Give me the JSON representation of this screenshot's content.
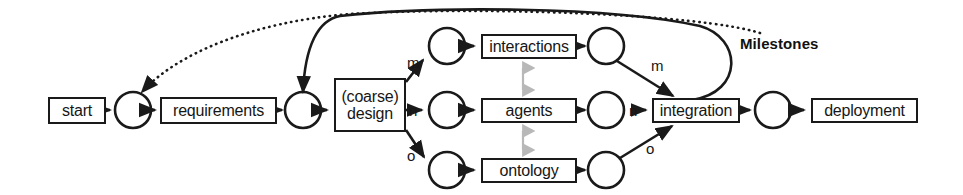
{
  "diagram": {
    "title_label": "Milestones",
    "boxes": [
      {
        "id": "start",
        "label": "start",
        "x": 48,
        "y": 97,
        "w": 58,
        "h": 27
      },
      {
        "id": "requirements",
        "label": "requirements",
        "x": 160,
        "y": 97,
        "w": 117,
        "h": 27
      },
      {
        "id": "design",
        "label": "(coarse)\ndesign",
        "x": 334,
        "y": 78,
        "w": 72,
        "h": 54
      },
      {
        "id": "interactions",
        "label": "interactions",
        "x": 481,
        "y": 34,
        "w": 96,
        "h": 25
      },
      {
        "id": "agents",
        "label": "agents",
        "x": 481,
        "y": 98,
        "w": 96,
        "h": 25
      },
      {
        "id": "ontology",
        "label": "ontology",
        "x": 481,
        "y": 158,
        "w": 96,
        "h": 25
      },
      {
        "id": "integration",
        "label": "integration",
        "x": 652,
        "y": 98,
        "w": 88,
        "h": 25
      },
      {
        "id": "deployment",
        "label": "deployment",
        "x": 811,
        "y": 98,
        "w": 107,
        "h": 25
      }
    ],
    "milestone_circles": [
      {
        "id": "m-after-start",
        "cx": 133,
        "cy": 110,
        "r": 18
      },
      {
        "id": "m-after-requirements",
        "cx": 303,
        "cy": 110,
        "r": 18
      },
      {
        "id": "m-before-interactions",
        "cx": 447,
        "cy": 46,
        "r": 18
      },
      {
        "id": "m-after-interactions",
        "cx": 606,
        "cy": 46,
        "r": 18
      },
      {
        "id": "m-before-agents",
        "cx": 447,
        "cy": 110,
        "r": 18
      },
      {
        "id": "m-after-agents",
        "cx": 606,
        "cy": 110,
        "r": 18
      },
      {
        "id": "m-before-ontology",
        "cx": 447,
        "cy": 170,
        "r": 18
      },
      {
        "id": "m-after-ontology",
        "cx": 606,
        "cy": 170,
        "r": 18
      },
      {
        "id": "m-after-integration",
        "cx": 773,
        "cy": 110,
        "r": 18
      }
    ],
    "edge_labels": [
      {
        "id": "design-to-interactions",
        "text": "m",
        "x": 407,
        "y": 55
      },
      {
        "id": "design-to-agents",
        "text": "n",
        "x": 409,
        "y": 103
      },
      {
        "id": "design-to-ontology",
        "text": "o",
        "x": 407,
        "y": 148
      },
      {
        "id": "interactions-to-integration",
        "text": "m",
        "x": 651,
        "y": 58
      },
      {
        "id": "agents-to-integration",
        "text": "n",
        "x": 629,
        "y": 103
      },
      {
        "id": "ontology-to-integration",
        "text": "o",
        "x": 646,
        "y": 141
      }
    ],
    "section_label": {
      "text": "Milestones",
      "x": 740,
      "y": 36
    },
    "colors": {
      "stroke": "#1a1a1a",
      "background": "#ffffff",
      "text": "#161616",
      "sync_arrow": "#b8b8b8"
    }
  }
}
